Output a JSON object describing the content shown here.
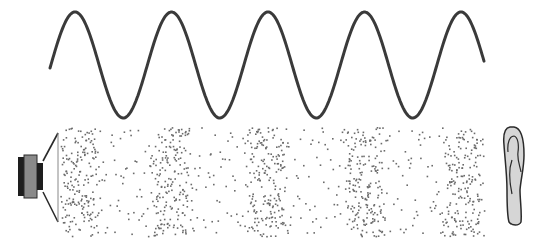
{
  "diagram": {
    "title": "",
    "colors": {
      "background": "#ffffff",
      "wave": "#3a3a3a",
      "particle": "#6b6b6b",
      "speaker_magnet": "#1e1e1e",
      "speaker_body": "#8a8a8a",
      "speaker_outline": "#2a2a2a",
      "ear_fill": "#d6d6d6",
      "ear_outline": "#2a2a2a"
    },
    "wave": {
      "x_start": 50,
      "x_end": 484,
      "center_y": 65,
      "amplitude": 53,
      "period": 96.5,
      "first_peak_x": 75,
      "stroke_width": 3
    },
    "particle_field": {
      "x_start": 60,
      "x_end": 488,
      "y_top": 127,
      "y_bottom": 236,
      "compression_centers_x": [
        78,
        170,
        266,
        364,
        462
      ],
      "compression_half_width": 17,
      "background_density": 0.9,
      "compression_density": 5.2,
      "particle_size": 1.6
    },
    "speaker": {
      "label": "speaker",
      "magnet": {
        "x": 18,
        "y": 157,
        "w": 8,
        "h": 39
      },
      "body": {
        "x": 24,
        "y": 155,
        "w": 13,
        "h": 43
      },
      "coil": {
        "x": 37,
        "y": 163,
        "w": 6,
        "h": 27
      },
      "cone_top": [
        [
          43,
          161
        ],
        [
          58,
          133
        ]
      ],
      "cone_bottom": [
        [
          43,
          192
        ],
        [
          58,
          222
        ]
      ],
      "diaphragm_x": 58
    },
    "ear": {
      "label": "ear"
    }
  }
}
